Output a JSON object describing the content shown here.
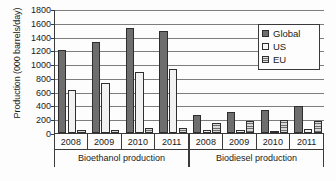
{
  "chart_data": {
    "type": "bar",
    "title": "",
    "xlabel": "",
    "ylabel": "Production (000 barrels/day)",
    "ylim": [
      0,
      1800
    ],
    "ytick_step": 200,
    "yticks": [
      0,
      200,
      400,
      600,
      800,
      1000,
      1200,
      1400,
      1600,
      1800
    ],
    "grid": "horizontal",
    "legend_position": "top-right",
    "legend": [
      "Global",
      "US",
      "EU"
    ],
    "group_labels": [
      "Bioethanol production",
      "Biodiesel production"
    ],
    "categories": [
      "2008",
      "2009",
      "2010",
      "2011",
      "2008",
      "2009",
      "2010",
      "2011"
    ],
    "series": [
      {
        "name": "Global",
        "color": "#6e6e6e",
        "values": [
          1210,
          1320,
          1520,
          1480,
          255,
          305,
          335,
          395
        ]
      },
      {
        "name": "US",
        "color": "#f2f2f2",
        "values": [
          625,
          730,
          890,
          935,
          45,
          40,
          25,
          60
        ]
      },
      {
        "name": "EU",
        "color": "#d8d8d8",
        "values": [
          50,
          48,
          68,
          70,
          150,
          178,
          185,
          175
        ]
      }
    ],
    "groups": [
      {
        "label": "Bioethanol production",
        "years": [
          "2008",
          "2009",
          "2010",
          "2011"
        ],
        "Global": [
          1210,
          1320,
          1520,
          1480
        ],
        "US": [
          625,
          730,
          890,
          935
        ],
        "EU": [
          50,
          48,
          68,
          70
        ]
      },
      {
        "label": "Biodiesel production",
        "years": [
          "2008",
          "2009",
          "2010",
          "2011"
        ],
        "Global": [
          255,
          305,
          335,
          395
        ],
        "US": [
          45,
          40,
          25,
          60
        ],
        "EU": [
          150,
          178,
          185,
          175
        ]
      }
    ]
  }
}
